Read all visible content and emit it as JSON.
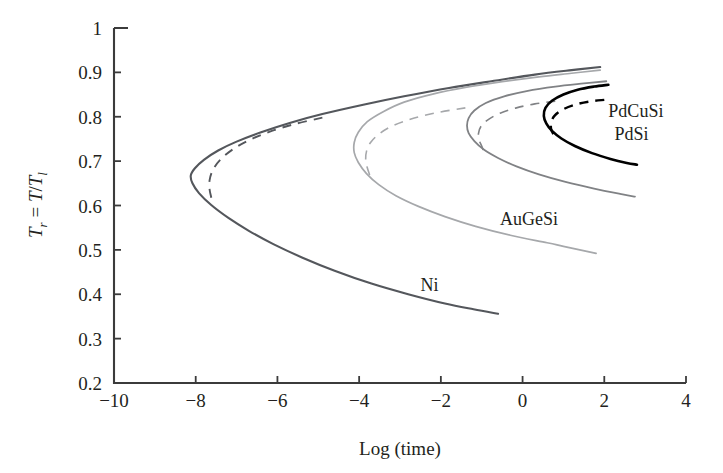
{
  "chart_data": {
    "type": "line",
    "title": "",
    "xlabel": "Log (time)",
    "ylabel": "T_r = T/T_l",
    "ylabel_parts": {
      "t1": "T",
      "sub1": "r",
      "eq": " = ",
      "t2": "T",
      "slash": "/",
      "t3": "T",
      "sub2": "l"
    },
    "xlim": [
      -10,
      4
    ],
    "ylim": [
      0.2,
      1.0
    ],
    "xticks": [
      -10,
      -8,
      -6,
      -4,
      -2,
      0,
      2,
      4
    ],
    "xtick_labels": [
      "−10",
      "−8",
      "−6",
      "−4",
      "−2",
      "0",
      "2",
      "4"
    ],
    "yticks": [
      0.2,
      0.3,
      0.4,
      0.5,
      0.6,
      0.7,
      0.8,
      0.9,
      1.0
    ],
    "ytick_labels": [
      "0.2",
      "0.3",
      "0.4",
      "0.5",
      "0.6",
      "0.7",
      "0.8",
      "0.9",
      "1"
    ],
    "grid": false,
    "legend": "inline-annotations",
    "series": [
      {
        "name": "Ni",
        "color": "#54575c",
        "width": 2.1,
        "style": "solid",
        "nose": {
          "x": -8.1,
          "y": 0.675
        },
        "points": [
          [
            1.9,
            0.912
          ],
          [
            1.2,
            0.905
          ],
          [
            0.3,
            0.895
          ],
          [
            -0.7,
            0.881
          ],
          [
            -1.8,
            0.865
          ],
          [
            -2.9,
            0.846
          ],
          [
            -3.9,
            0.827
          ],
          [
            -4.9,
            0.806
          ],
          [
            -5.7,
            0.786
          ],
          [
            -6.4,
            0.765
          ],
          [
            -7.0,
            0.744
          ],
          [
            -7.45,
            0.724
          ],
          [
            -7.8,
            0.703
          ],
          [
            -8.02,
            0.684
          ],
          [
            -8.12,
            0.668
          ],
          [
            -8.08,
            0.65
          ],
          [
            -7.92,
            0.628
          ],
          [
            -7.62,
            0.601
          ],
          [
            -7.2,
            0.572
          ],
          [
            -6.7,
            0.543
          ],
          [
            -6.1,
            0.513
          ],
          [
            -5.4,
            0.483
          ],
          [
            -4.6,
            0.453
          ],
          [
            -3.7,
            0.424
          ],
          [
            -2.8,
            0.4
          ],
          [
            -1.9,
            0.379
          ],
          [
            -1.2,
            0.366
          ],
          [
            -0.6,
            0.356
          ]
        ],
        "dashed": {
          "points": [
            [
              -4.9,
              0.798
            ],
            [
              -5.6,
              0.783
            ],
            [
              -6.2,
              0.766
            ],
            [
              -6.7,
              0.747
            ],
            [
              -7.1,
              0.726
            ],
            [
              -7.4,
              0.703
            ],
            [
              -7.58,
              0.68
            ],
            [
              -7.66,
              0.657
            ],
            [
              -7.66,
              0.636
            ],
            [
              -7.62,
              0.618
            ],
            [
              -7.6,
              0.603
            ]
          ]
        },
        "label": {
          "text": "Ni",
          "x": -2.5,
          "y": 0.408
        }
      },
      {
        "name": "AuGeSi",
        "color": "#a6a8ab",
        "width": 1.7,
        "style": "solid",
        "nose": {
          "x": -4.0,
          "y": 0.705
        },
        "points": [
          [
            1.9,
            0.905
          ],
          [
            1.2,
            0.898
          ],
          [
            0.4,
            0.89
          ],
          [
            -0.5,
            0.879
          ],
          [
            -1.4,
            0.866
          ],
          [
            -2.2,
            0.851
          ],
          [
            -2.9,
            0.833
          ],
          [
            -3.4,
            0.812
          ],
          [
            -3.8,
            0.789
          ],
          [
            -4.02,
            0.765
          ],
          [
            -4.12,
            0.742
          ],
          [
            -4.12,
            0.719
          ],
          [
            -4.02,
            0.697
          ],
          [
            -3.82,
            0.672
          ],
          [
            -3.52,
            0.647
          ],
          [
            -3.1,
            0.622
          ],
          [
            -2.55,
            0.598
          ],
          [
            -1.9,
            0.575
          ],
          [
            -1.15,
            0.553
          ],
          [
            -0.3,
            0.533
          ],
          [
            0.6,
            0.516
          ],
          [
            1.0,
            0.508
          ],
          [
            1.8,
            0.492
          ]
        ],
        "dashed": {
          "points": [
            [
              -1.4,
              0.82
            ],
            [
              -2.05,
              0.81
            ],
            [
              -2.65,
              0.797
            ],
            [
              -3.15,
              0.781
            ],
            [
              -3.5,
              0.762
            ],
            [
              -3.72,
              0.742
            ],
            [
              -3.82,
              0.722
            ],
            [
              -3.84,
              0.703
            ],
            [
              -3.8,
              0.685
            ],
            [
              -3.74,
              0.668
            ],
            [
              -3.7,
              0.655
            ]
          ]
        },
        "label": {
          "text": "AuGeSi",
          "x": -0.55,
          "y": 0.555
        }
      },
      {
        "name": "PdSi",
        "color": "#808285",
        "width": 1.8,
        "style": "solid",
        "nose": {
          "x": -1.2,
          "y": 0.78
        },
        "points": [
          [
            2.05,
            0.88
          ],
          [
            1.5,
            0.875
          ],
          [
            0.8,
            0.868
          ],
          [
            0.1,
            0.858
          ],
          [
            -0.45,
            0.846
          ],
          [
            -0.9,
            0.831
          ],
          [
            -1.18,
            0.814
          ],
          [
            -1.32,
            0.797
          ],
          [
            -1.36,
            0.78
          ],
          [
            -1.32,
            0.763
          ],
          [
            -1.18,
            0.745
          ],
          [
            -0.95,
            0.726
          ],
          [
            -0.6,
            0.707
          ],
          [
            -0.15,
            0.688
          ],
          [
            0.4,
            0.67
          ],
          [
            1.05,
            0.653
          ],
          [
            1.75,
            0.638
          ],
          [
            2.45,
            0.625
          ],
          [
            2.75,
            0.62
          ]
        ],
        "dashed": {
          "points": [
            [
              0.8,
              0.835
            ],
            [
              0.3,
              0.829
            ],
            [
              -0.15,
              0.82
            ],
            [
              -0.55,
              0.808
            ],
            [
              -0.85,
              0.793
            ],
            [
              -1.02,
              0.778
            ],
            [
              -1.08,
              0.762
            ],
            [
              -1.06,
              0.747
            ],
            [
              -1.0,
              0.734
            ],
            [
              -0.96,
              0.724
            ]
          ]
        },
        "label": {
          "text": "PdSi",
          "x": 2.25,
          "y": 0.747
        }
      },
      {
        "name": "PdCuSi",
        "color": "#000000",
        "width": 2.6,
        "style": "solid",
        "nose": {
          "x": 0.8,
          "y": 0.8
        },
        "points": [
          [
            2.1,
            0.872
          ],
          [
            1.75,
            0.868
          ],
          [
            1.35,
            0.861
          ],
          [
            1.0,
            0.85
          ],
          [
            0.72,
            0.836
          ],
          [
            0.56,
            0.82
          ],
          [
            0.52,
            0.802
          ],
          [
            0.58,
            0.785
          ],
          [
            0.72,
            0.768
          ],
          [
            0.95,
            0.751
          ],
          [
            1.28,
            0.734
          ],
          [
            1.7,
            0.718
          ],
          [
            2.15,
            0.705
          ],
          [
            2.55,
            0.696
          ],
          [
            2.8,
            0.692
          ]
        ],
        "dashed": {
          "points": [
            [
              2.0,
              0.838
            ],
            [
              1.62,
              0.834
            ],
            [
              1.28,
              0.827
            ],
            [
              0.98,
              0.816
            ],
            [
              0.78,
              0.802
            ],
            [
              0.7,
              0.787
            ],
            [
              0.7,
              0.772
            ],
            [
              0.76,
              0.76
            ],
            [
              0.82,
              0.751
            ]
          ]
        },
        "label": {
          "text": "PdCuSi",
          "x": 2.1,
          "y": 0.8
        }
      }
    ]
  }
}
